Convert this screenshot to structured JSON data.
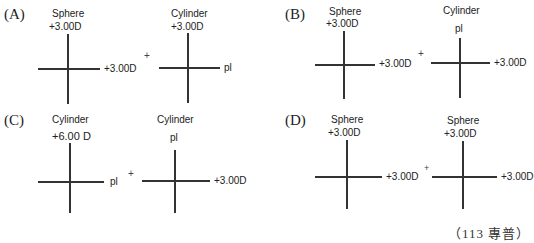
{
  "options": [
    {
      "label": "(A)",
      "left": {
        "type": "Sphere",
        "vertical": "+3.00D",
        "horizontal": "+3.00D"
      },
      "right": {
        "type": "Cylinder",
        "vertical": "+3.00D",
        "horizontal": "pl"
      }
    },
    {
      "label": "(B)",
      "left": {
        "type": "Sphere",
        "vertical": "+3.00D",
        "horizontal": "+3.00D"
      },
      "right": {
        "type": "Cylinder",
        "vertical": "pl",
        "horizontal": "+3.00D"
      }
    },
    {
      "label": "(C)",
      "left": {
        "type": "Cylinder",
        "vertical": "+6.00 D",
        "horizontal": "pl"
      },
      "right": {
        "type": "Cylinder",
        "vertical": "pl",
        "horizontal": "+3.00D"
      }
    },
    {
      "label": "(D)",
      "left": {
        "type": "Sphere",
        "vertical": "+3.00D",
        "horizontal": "+3.00D"
      },
      "right": {
        "type": "Sphere",
        "vertical": "+3.00D",
        "horizontal": "+3.00D"
      }
    }
  ],
  "plus_sign": "+",
  "caption": "（113 專普）"
}
